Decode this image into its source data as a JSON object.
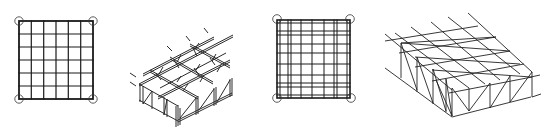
{
  "figure": {
    "panels": [
      {
        "id": "a",
        "type": "plan",
        "label": "two-way grid plan (6x6 bays, corner supports)",
        "cols": 6,
        "rows": 6,
        "supports": 4
      },
      {
        "id": "b",
        "type": "isometric",
        "label": "two-way truss grid isometric (3x3 bays)"
      },
      {
        "id": "c",
        "type": "plan",
        "label": "two-way grid plan with paired members (corner supports)",
        "supports": 4
      },
      {
        "id": "d",
        "type": "isometric",
        "label": "space frame with diagonal bracing isometric"
      }
    ],
    "colors": {
      "line": "#1a1a1a",
      "background": "#ffffff"
    }
  }
}
